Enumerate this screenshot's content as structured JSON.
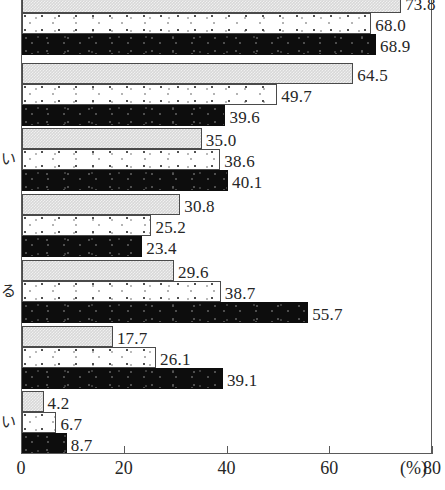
{
  "chart_data": {
    "type": "bar",
    "orientation": "horizontal",
    "title": "",
    "subtitle": "",
    "xlabel": "(%)",
    "ylabel": "",
    "xlim": [
      0,
      80
    ],
    "xticks": [
      0,
      20,
      40,
      60,
      80
    ],
    "xtick_labels": [
      "0",
      "20",
      "40",
      "60",
      "80"
    ],
    "unit_label": "(%)",
    "grid": false,
    "legend": "none",
    "categories": [
      "",
      "",
      "い",
      "",
      "る",
      "",
      "い"
    ],
    "category_labels_clipped": true,
    "series": [
      {
        "name": "series-1",
        "style": "light-gray",
        "values": [
          73.8,
          64.5,
          35.0,
          30.8,
          29.6,
          17.7,
          4.2
        ]
      },
      {
        "name": "series-2",
        "style": "white-dotted",
        "values": [
          68.0,
          49.7,
          38.6,
          25.2,
          38.7,
          26.1,
          6.7
        ]
      },
      {
        "name": "series-3",
        "style": "black",
        "values": [
          68.9,
          39.6,
          40.1,
          23.4,
          55.7,
          39.1,
          8.7
        ]
      }
    ],
    "value_labels": [
      [
        "73.8",
        "68.0",
        "68.9"
      ],
      [
        "64.5",
        "49.7",
        "39.6"
      ],
      [
        "35.0",
        "38.6",
        "40.1"
      ],
      [
        "30.8",
        "25.2",
        "23.4"
      ],
      [
        "29.6",
        "38.7",
        "55.7"
      ],
      [
        "17.7",
        "26.1",
        "39.1"
      ],
      [
        "4.2",
        "6.7",
        "8.7"
      ]
    ]
  },
  "colors": {
    "series_1": "#d8d8d8",
    "series_2": "#ffffff",
    "series_3": "#0d0d0d",
    "axis": "#5a5a5a",
    "text": "#262626",
    "background": "#ffffff"
  }
}
